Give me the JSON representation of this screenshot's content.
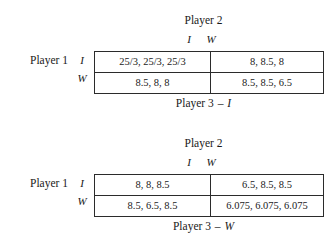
{
  "matrices": [
    {
      "column_player_label": "Player 2",
      "column_strategies": [
        "I",
        "W"
      ],
      "row_player_label": "Player 1",
      "row_strategies": [
        "I",
        "W"
      ],
      "caption_player": "Player 3",
      "caption_dash": "–",
      "caption_strategy": "I",
      "cells": [
        [
          "25/3, 25/3, 25/3",
          "8, 8.5, 8"
        ],
        [
          "8.5, 8, 8",
          "8.5, 8.5, 6.5"
        ]
      ]
    },
    {
      "column_player_label": "Player 2",
      "column_strategies": [
        "I",
        "W"
      ],
      "row_player_label": "Player 1",
      "row_strategies": [
        "I",
        "W"
      ],
      "caption_player": "Player 3",
      "caption_dash": "–",
      "caption_strategy": "W",
      "cells": [
        [
          "8, 8, 8.5",
          "6.5, 8.5, 8.5"
        ],
        [
          "8.5, 6.5, 8.5",
          "6.075, 6.075, 6.075"
        ]
      ]
    }
  ],
  "chart_data": {
    "type": "table",
    "players": [
      "Player 1",
      "Player 2",
      "Player 3"
    ],
    "strategies": [
      "I",
      "W"
    ],
    "tables": [
      {
        "condition": "Player 3 - I",
        "row_player": "Player 1",
        "column_player": "Player 2",
        "row_labels": [
          "I",
          "W"
        ],
        "column_labels": [
          "I",
          "W"
        ],
        "payoffs": [
          [
            [
              "25/3",
              "25/3",
              "25/3"
            ],
            [
              "8",
              "8.5",
              "8"
            ]
          ],
          [
            [
              "8.5",
              "8",
              "8"
            ],
            [
              "8.5",
              "8.5",
              "6.5"
            ]
          ]
        ]
      },
      {
        "condition": "Player 3 - W",
        "row_player": "Player 1",
        "column_player": "Player 2",
        "row_labels": [
          "I",
          "W"
        ],
        "column_labels": [
          "I",
          "W"
        ],
        "payoffs": [
          [
            [
              "8",
              "8",
              "8.5"
            ],
            [
              "6.5",
              "8.5",
              "8.5"
            ]
          ],
          [
            [
              "8.5",
              "6.5",
              "8.5"
            ],
            [
              "6.075",
              "6.075",
              "6.075"
            ]
          ]
        ]
      }
    ]
  }
}
